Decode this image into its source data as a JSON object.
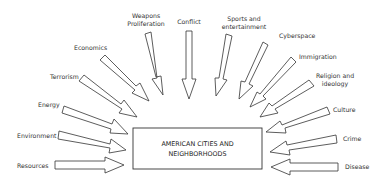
{
  "center": {
    "line1": "AMERICAN CITIES AND",
    "line2": "NEIGHBORHOODS"
  },
  "factors": [
    {
      "id": "resources",
      "label": "Resources"
    },
    {
      "id": "environment",
      "label": "Environment"
    },
    {
      "id": "energy",
      "label": "Energy"
    },
    {
      "id": "terrorism",
      "label": "Terrorism"
    },
    {
      "id": "economics",
      "label": "Economics"
    },
    {
      "id": "weapons",
      "label1": "Weapons",
      "label2": "Proliferation"
    },
    {
      "id": "conflict",
      "label": "Conflict"
    },
    {
      "id": "sports",
      "label1": "Sports and",
      "label2": "entertainment"
    },
    {
      "id": "cyberspace",
      "label": "Cyberspace"
    },
    {
      "id": "immigration",
      "label": "Immigration"
    },
    {
      "id": "religion",
      "label1": "Religion and",
      "label2": "ideology"
    },
    {
      "id": "culture",
      "label": "Culture"
    },
    {
      "id": "crime",
      "label": "Crime"
    },
    {
      "id": "disease",
      "label": "Disease"
    }
  ],
  "colors": {
    "stroke": "#333333",
    "background": "#ffffff"
  }
}
